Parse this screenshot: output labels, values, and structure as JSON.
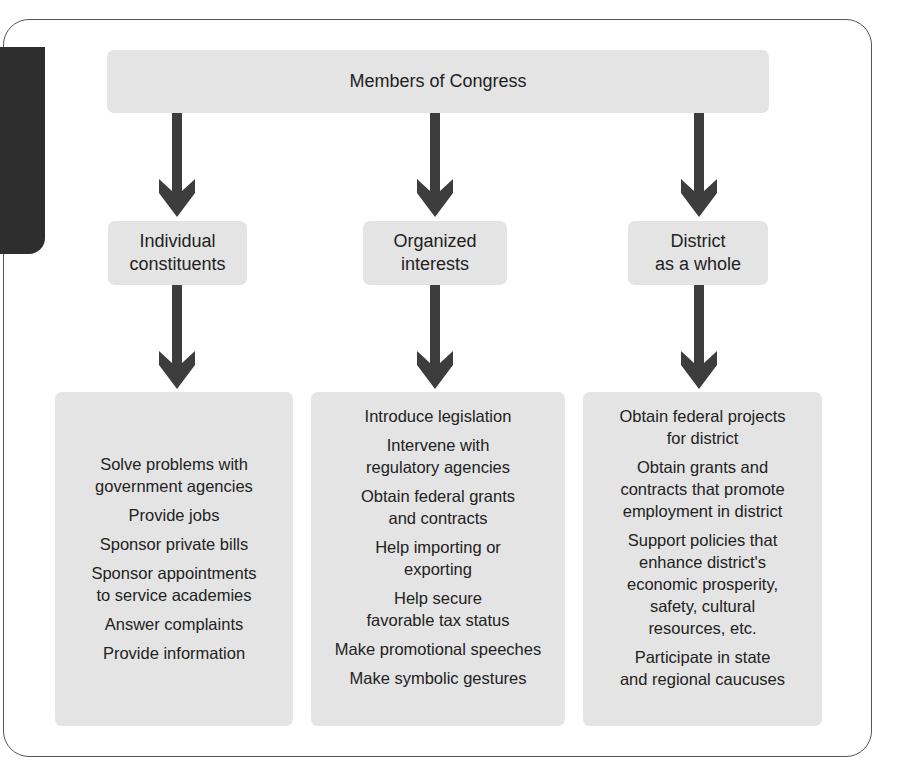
{
  "diagram": {
    "top": {
      "label": "Members of Congress"
    },
    "categories": [
      {
        "label": "Individual\nconstituents",
        "activities": [
          "Solve problems with\ngovernment agencies",
          "Provide jobs",
          "Sponsor private bills",
          "Sponsor appointments\nto service academies",
          "Answer complaints",
          "Provide information"
        ]
      },
      {
        "label": "Organized\ninterests",
        "activities": [
          "Introduce legislation",
          "Intervene with\nregulatory agencies",
          "Obtain federal grants\nand contracts",
          "Help importing or\nexporting",
          "Help secure\nfavorable tax status",
          "Make promotional speeches",
          "Make symbolic gestures"
        ]
      },
      {
        "label": "District\nas a whole",
        "activities": [
          "Obtain federal projects\nfor district",
          "Obtain grants and\ncontracts that promote\nemployment in district",
          "Support policies that\nenhance district's\neconomic prosperity,\nsafety, cultural\nresources, etc.",
          "Participate in state\nand regional caucuses"
        ]
      }
    ],
    "colors": {
      "box_fill": "#e4e4e4",
      "arrow": "#3d3d3d",
      "text": "#222222",
      "frame": "#555555",
      "side_tab": "#2e2e2e"
    }
  }
}
